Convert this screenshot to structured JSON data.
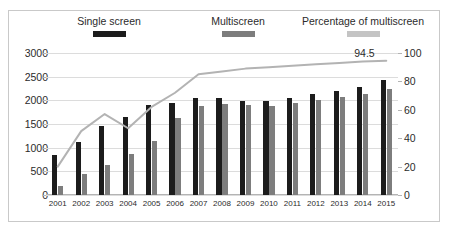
{
  "chart_data": {
    "type": "bar",
    "title": "",
    "xlabel": "",
    "ylabel": "",
    "grid": true,
    "legend_position": "top",
    "categories": [
      "2001",
      "2002",
      "2003",
      "2004",
      "2005",
      "2006",
      "2007",
      "2008",
      "2009",
      "2010",
      "2011",
      "2012",
      "2013",
      "2014",
      "2015"
    ],
    "y_left": {
      "label": "",
      "min": 0,
      "max": 3000,
      "ticks": [
        0,
        500,
        1000,
        1500,
        2000,
        2500,
        3000
      ]
    },
    "y_right": {
      "label": "",
      "min": 0,
      "max": 100,
      "ticks": [
        0,
        20,
        40,
        60,
        80,
        100
      ]
    },
    "series": [
      {
        "name": "Single screen",
        "type": "bar",
        "axis": "left",
        "color": "#1c1c1c",
        "values": [
          840,
          1130,
          1450,
          1640,
          1900,
          1950,
          2040,
          2060,
          1990,
          1980,
          2050,
          2140,
          2200,
          2290,
          2420
        ]
      },
      {
        "name": "Multiscreen",
        "type": "bar",
        "axis": "left",
        "color": "#7d7d7d",
        "values": [
          200,
          450,
          640,
          870,
          1150,
          1620,
          1880,
          1930,
          1900,
          1890,
          1950,
          2000,
          2080,
          2140,
          2250
        ]
      },
      {
        "name": "Percentage of multiscreen",
        "type": "line",
        "axis": "right",
        "color": "#b3b3b3",
        "values": [
          20,
          45,
          57,
          47,
          62,
          72,
          85,
          87,
          89,
          90,
          91,
          92,
          93,
          94,
          94.5
        ]
      }
    ],
    "annotations": [
      {
        "text": "94.5",
        "series": "Percentage of multiscreen",
        "category": "2015"
      }
    ]
  },
  "legend": {
    "items": [
      {
        "label": "Single screen",
        "color": "#1c1c1c"
      },
      {
        "label": "Multiscreen",
        "color": "#7d7d7d"
      },
      {
        "label": "Percentage of multiscreen",
        "color": "#c4c4c4"
      }
    ]
  }
}
